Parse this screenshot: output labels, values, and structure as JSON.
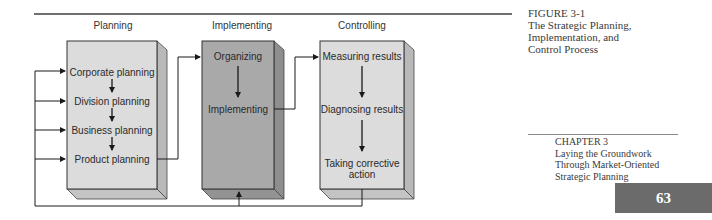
{
  "diagram": {
    "columns": [
      {
        "label": "Planning"
      },
      {
        "label": "Implementing"
      },
      {
        "label": "Controlling"
      }
    ],
    "planning_steps": [
      "Corporate planning",
      "Division planning",
      "Business planning",
      "Product planning"
    ],
    "implementing_steps": [
      "Organizing",
      "Implementing"
    ],
    "controlling_steps": [
      "Measuring results",
      "Diagnosing results",
      "Taking corrective",
      "action"
    ],
    "colors": {
      "planning_box": "#dcdcdc",
      "implementing_box": "#a9a9a9",
      "controlling_box": "#dcdcdc",
      "box_side": "#b8b8b8",
      "rule": "#6f6f6f"
    }
  },
  "caption": {
    "figure_label": "FIGURE 3-1",
    "title_lines": [
      "The Strategic Planning,",
      "Implementation, and",
      "Control Process"
    ]
  },
  "chapter": {
    "label": "CHAPTER 3",
    "title_lines": [
      "Laying the Groundwork",
      "Through Market-Oriented",
      "Strategic Planning"
    ]
  },
  "page_number": "63"
}
